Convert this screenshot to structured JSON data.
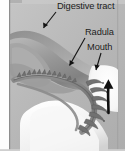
{
  "figure": {
    "domain": "diagram",
    "title": "",
    "background_color": "#b9b9b9",
    "frame": {
      "left_margin_color": "#fdfdfd",
      "border_color": "#8d8d8d"
    }
  },
  "labels": [
    {
      "id": "digestive-tract",
      "text": "Digestive tract",
      "x": 57,
      "y": 1,
      "leader": {
        "from_x": 56,
        "from_y": 12,
        "to_x": 42,
        "to_y": 30
      }
    },
    {
      "id": "radula",
      "text": "Radula",
      "x": 85,
      "y": 27,
      "leader": {
        "from_x": 85,
        "from_y": 38,
        "to_x": 68,
        "to_y": 67
      }
    },
    {
      "id": "mouth",
      "text": "Mouth",
      "x": 87,
      "y": 42,
      "leader": {
        "from_x": 100,
        "from_y": 53,
        "to_x": 95,
        "to_y": 70
      }
    }
  ],
  "annotations": [
    {
      "id": "motion-arrow",
      "type": "arrow",
      "direction": "up",
      "color": "#111111",
      "x": 108,
      "y_start": 113,
      "y_end": 80
    }
  ],
  "structures": [
    {
      "id": "digestive-tract-body",
      "fill": "#9d9d9d",
      "description": "large curved tissue mass, upper left"
    },
    {
      "id": "radula-ribbon",
      "fill": "#8a8a8a",
      "description": "toothed ribbon curving from left to mouth"
    },
    {
      "id": "radula-teeth",
      "count": 22,
      "fill": "#6f6f6f",
      "description": "row of small recurved teeth along ribbon"
    },
    {
      "id": "mouth-opening",
      "fill": "#f7f7f7",
      "description": "light opening at right"
    },
    {
      "id": "lower-tissue",
      "fill": "#f2f2f2",
      "description": "pale lower lip / foot tissue"
    }
  ],
  "colors": {
    "background": "#b9b9b9",
    "tissue_mid": "#9d9d9d",
    "tissue_dark": "#6f6f6f",
    "tissue_light": "#f2f2f2",
    "ink": "#1b1b1b",
    "arrow": "#111111"
  }
}
